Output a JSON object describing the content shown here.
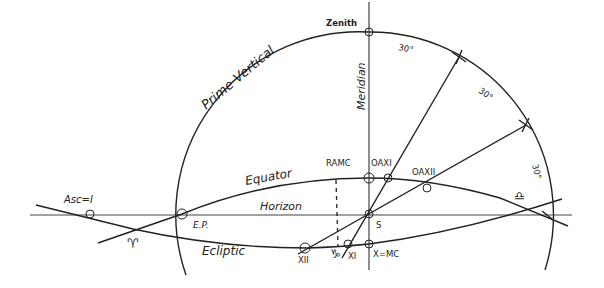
{
  "diagram": {
    "labels": {
      "zenith": "Zenith",
      "prime_vertical": "Prime Vertical",
      "meridian": "Meridian",
      "equator": "Equator",
      "horizon": "Horizon",
      "ecliptic": "Ecliptic",
      "ramc": "RAMC",
      "oax1": "OAXI",
      "oax2": "OAXII",
      "ep": "E.P.",
      "asc": "Asc=I",
      "s": "S",
      "xii": "XII",
      "xi": "XI",
      "x_mc": "X=MC",
      "aries": "♈",
      "libra": "♎",
      "cancer_mark": "♑",
      "angle1": "30°",
      "angle2": "30°",
      "angle3": "30°"
    },
    "colors": {
      "ink": "#222222",
      "background": "#ffffff"
    }
  }
}
